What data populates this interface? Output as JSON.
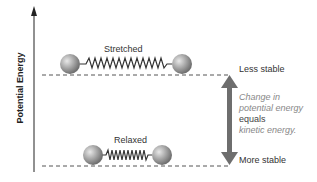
{
  "axis": {
    "ylabel": "Potential Energy"
  },
  "states": {
    "stretched": {
      "label": "Stretched",
      "level": "Less stable"
    },
    "relaxed": {
      "label": "Relaxed",
      "level": "More stable"
    }
  },
  "note": {
    "line1": "Change in",
    "line2": "potential energy",
    "line3": "equals",
    "line4": "kinetic energy."
  },
  "colors": {
    "arrow": "#6e6e6e",
    "ball": "#9a9a9a",
    "dash": "#555555"
  }
}
